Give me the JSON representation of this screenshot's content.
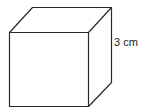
{
  "diagram": {
    "shape": "cube",
    "edge_label": "3 cm",
    "stroke_color": "#2a2a2a",
    "background": "#ffffff"
  }
}
